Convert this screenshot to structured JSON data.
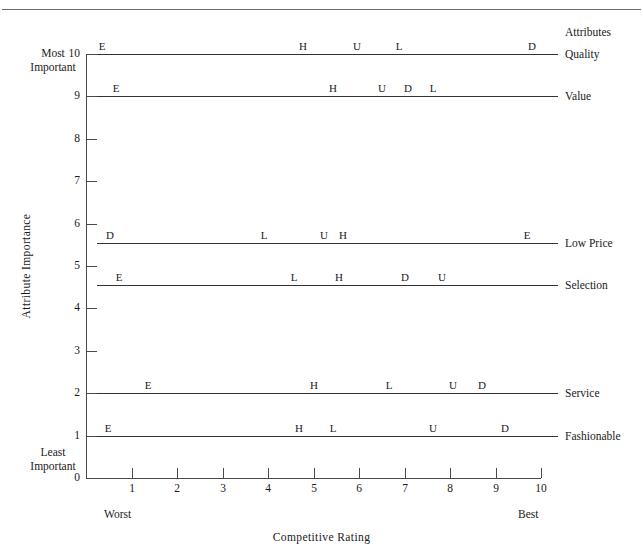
{
  "header": {
    "attributes_header": "Attributes"
  },
  "axes": {
    "y_title": "Attribute  Importance",
    "x_title": "Competitive  Rating",
    "y_top_caption_line1": "Most",
    "y_top_caption_line2": "Important",
    "y_bottom_caption_line1": "Least",
    "y_bottom_caption_line2": "Important",
    "x_left_caption": "Worst",
    "x_right_caption": "Best",
    "y_ticks": [
      "0",
      "1",
      "2",
      "3",
      "4",
      "5",
      "6",
      "7",
      "8",
      "9",
      "10"
    ],
    "x_ticks": [
      "1",
      "2",
      "3",
      "4",
      "5",
      "6",
      "7",
      "8",
      "9",
      "10"
    ]
  },
  "chart_data": {
    "type": "scatter",
    "title": "",
    "xlabel": "Competitive  Rating",
    "ylabel": "Attribute  Importance",
    "xlim": [
      0,
      10
    ],
    "ylim": [
      0,
      10
    ],
    "grid": false,
    "legend": "none",
    "x_axis_endpoints": {
      "left": "Worst",
      "right": "Best"
    },
    "y_axis_endpoints": {
      "top": "Most Important",
      "bottom": "Least Important"
    },
    "rows": [
      {
        "attribute": "Quality",
        "importance": 10,
        "marks": [
          {
            "label": "E",
            "rating": 0.35
          },
          {
            "label": "H",
            "rating": 4.78
          },
          {
            "label": "U",
            "rating": 5.95
          },
          {
            "label": "L",
            "rating": 6.87
          },
          {
            "label": "D",
            "rating": 9.8
          }
        ]
      },
      {
        "attribute": "Value",
        "importance": 9,
        "marks": [
          {
            "label": "E",
            "rating": 0.66
          },
          {
            "label": "H",
            "rating": 5.43
          },
          {
            "label": "U",
            "rating": 6.51
          },
          {
            "label": "D",
            "rating": 7.08
          },
          {
            "label": "L",
            "rating": 7.63
          }
        ]
      },
      {
        "attribute": "Low Price",
        "importance": 5.55,
        "marks": [
          {
            "label": "D",
            "rating": 0.53
          },
          {
            "label": "L",
            "rating": 3.92
          },
          {
            "label": "U",
            "rating": 5.22
          },
          {
            "label": "H",
            "rating": 5.64
          },
          {
            "label": "E",
            "rating": 9.69
          }
        ]
      },
      {
        "attribute": "Selection",
        "importance": 4.55,
        "marks": [
          {
            "label": "E",
            "rating": 0.73
          },
          {
            "label": "L",
            "rating": 4.58
          },
          {
            "label": "H",
            "rating": 5.57
          },
          {
            "label": "D",
            "rating": 7.0
          },
          {
            "label": "U",
            "rating": 7.82
          }
        ]
      },
      {
        "attribute": "Service",
        "importance": 2,
        "marks": [
          {
            "label": "E",
            "rating": 1.37
          },
          {
            "label": "H",
            "rating": 5.02
          },
          {
            "label": "L",
            "rating": 6.65
          },
          {
            "label": "U",
            "rating": 8.06
          },
          {
            "label": "D",
            "rating": 8.7
          }
        ]
      },
      {
        "attribute": "Fashionable",
        "importance": 1,
        "marks": [
          {
            "label": "E",
            "rating": 0.48
          },
          {
            "label": "H",
            "rating": 4.69
          },
          {
            "label": "L",
            "rating": 5.42
          },
          {
            "label": "U",
            "rating": 7.62
          },
          {
            "label": "D",
            "rating": 9.2
          }
        ]
      }
    ]
  },
  "geometry": {
    "plot_left": 86,
    "plot_right": 541,
    "plot_top": 54,
    "plot_bottom": 478,
    "line_start_x": 97,
    "line_end_x": 558
  }
}
